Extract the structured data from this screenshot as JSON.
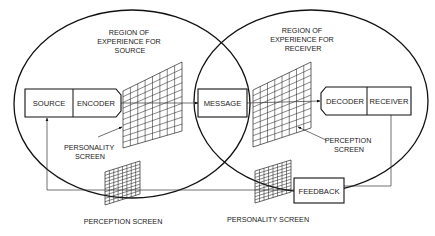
{
  "diagram": {
    "type": "communication-model",
    "regions": {
      "source": {
        "lines": [
          "REGION OF",
          "EXPERIENCE FOR",
          "SOURCE"
        ]
      },
      "receiver": {
        "lines": [
          "REGION OF",
          "EXPERIENCE FOR",
          "RECEIVER"
        ]
      }
    },
    "nodes": {
      "source": "SOURCE",
      "encoder": "ENCODER",
      "message": "MESSAGE",
      "decoder": "DECODER",
      "receiver": "RECEIVER",
      "feedback": "FEEDBACK"
    },
    "screens": {
      "source_personality": {
        "lines": [
          "PERSONALITY",
          "SCREEN"
        ]
      },
      "receiver_perception": {
        "lines": [
          "PERCEPTION",
          "SCREEN"
        ]
      },
      "feedback_perception": {
        "lines": [
          "PERCEPTION SCREEN"
        ]
      },
      "feedback_personality": {
        "lines": [
          "PERSONALITY SCREEN"
        ]
      }
    },
    "edges": [
      {
        "from": "encoder",
        "to": "message"
      },
      {
        "from": "message",
        "to": "decoder"
      },
      {
        "from": "receiver",
        "to": "feedback"
      },
      {
        "from": "feedback",
        "to": "source"
      }
    ]
  }
}
